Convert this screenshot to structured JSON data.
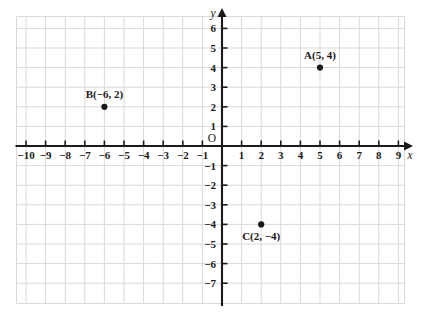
{
  "chart_data": {
    "type": "scatter",
    "title": "",
    "xlabel": "x",
    "ylabel": "y",
    "origin_label": "O",
    "xlim": [
      -10.5,
      10.1
    ],
    "ylim": [
      -7.6,
      6.9
    ],
    "grid": true,
    "legend": "none",
    "x_ticks": [
      -10,
      -9,
      -8,
      -7,
      -6,
      -5,
      -4,
      -3,
      -2,
      -1,
      1,
      2,
      3,
      4,
      5,
      6,
      7,
      8,
      9
    ],
    "y_ticks": [
      6,
      5,
      4,
      3,
      2,
      1,
      -1,
      -2,
      -3,
      -4,
      -5,
      -6,
      -7
    ],
    "x_tick_labels": [
      "−10",
      "−9",
      "−8",
      "−7",
      "−6",
      "−5",
      "−4",
      "−3",
      "−2",
      "−1",
      "1",
      "2",
      "3",
      "4",
      "5",
      "6",
      "7",
      "8",
      "9"
    ],
    "y_tick_labels": [
      "6",
      "5",
      "4",
      "3",
      "2",
      "1",
      "−1",
      "−2",
      "−3",
      "−4",
      "−5",
      "−6",
      "−7"
    ],
    "points": [
      {
        "name": "A",
        "x": 5,
        "y": 4,
        "label": "A(5, 4)",
        "label_position": "above"
      },
      {
        "name": "B",
        "x": -6,
        "y": 2,
        "label": "B(−6, 2)",
        "label_position": "above"
      },
      {
        "name": "C",
        "x": 2,
        "y": -4,
        "label": "C(2, −4)",
        "label_position": "below"
      }
    ],
    "colors": {
      "axis": "#1a1a1a",
      "grid": "#d9d9d9",
      "point": "#1a1a1a",
      "text": "#1a1a1a",
      "background": "#ffffff"
    }
  }
}
